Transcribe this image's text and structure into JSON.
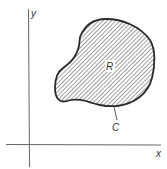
{
  "diagram": {
    "type": "region-in-plane",
    "axes": {
      "x_label": "x",
      "y_label": "y"
    },
    "region": {
      "label": "R",
      "fill": "diagonal-hatch"
    },
    "curve": {
      "label": "C"
    },
    "colors": {
      "stroke": "#2a2a2a",
      "axis": "#555555",
      "hatch": "#555555",
      "background": "#ffffff"
    }
  }
}
